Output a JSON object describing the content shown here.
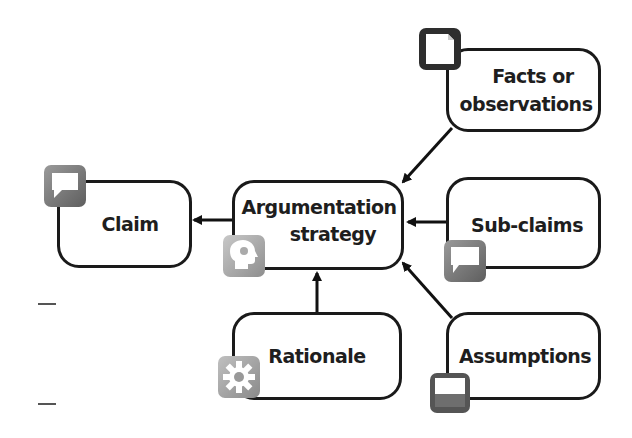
{
  "diagram": {
    "nodes": [
      {
        "id": "claim",
        "label": "Claim",
        "icon": "speech-bubble-icon"
      },
      {
        "id": "argumentation",
        "label": "Argumentation strategy",
        "line1": "Argumentation",
        "line2": "strategy",
        "icon": "head-gear-icon"
      },
      {
        "id": "facts",
        "label": "Facts or observations",
        "line1": "Facts or",
        "line2": "observations",
        "icon": "document-icon"
      },
      {
        "id": "subclaims",
        "label": "Sub-claims",
        "icon": "speech-bubble-icon"
      },
      {
        "id": "rationale",
        "label": "Rationale",
        "icon": "gear-icon"
      },
      {
        "id": "assumptions",
        "label": "Assumptions",
        "icon": "window-icon"
      }
    ],
    "edges": [
      {
        "from": "argumentation",
        "to": "claim"
      },
      {
        "from": "facts",
        "to": "argumentation"
      },
      {
        "from": "subclaims",
        "to": "argumentation"
      },
      {
        "from": "rationale",
        "to": "argumentation"
      },
      {
        "from": "assumptions",
        "to": "argumentation"
      }
    ]
  }
}
